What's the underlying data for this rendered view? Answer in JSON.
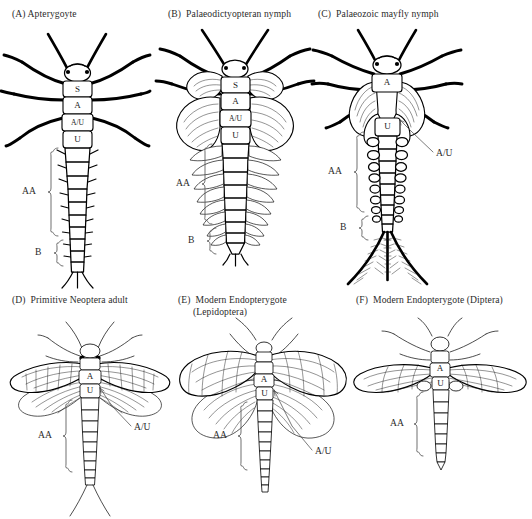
{
  "figure": {
    "background_color": "#ffffff",
    "ink_color": "#000000",
    "style": "black-and-white line drawing, scientific illustration"
  },
  "panels": [
    {
      "id": "A",
      "title": "(A) Apterygoyte",
      "segment_labels": [
        "S",
        "A",
        "A/U",
        "U"
      ],
      "brackets": [
        {
          "label": "AA"
        },
        {
          "label": "B"
        }
      ],
      "leader_labels": []
    },
    {
      "id": "B",
      "title": "(B)  Palaeodictyopteran nymph",
      "segment_labels": [
        "S",
        "A",
        "A/U",
        "U"
      ],
      "brackets": [
        {
          "label": "AA"
        },
        {
          "label": "B"
        }
      ],
      "leader_labels": []
    },
    {
      "id": "C",
      "title": "(C)  Palaeozoic mayfly nymph",
      "segment_labels": [
        "A",
        "U"
      ],
      "brackets": [
        {
          "label": "AA"
        },
        {
          "label": "B"
        }
      ],
      "leader_labels": [
        "A/U"
      ]
    },
    {
      "id": "D",
      "title": "(D)  Primitive Neoptera adult",
      "segment_labels": [
        "A",
        "U"
      ],
      "brackets": [
        {
          "label": "AA"
        }
      ],
      "leader_labels": [
        "A/U"
      ]
    },
    {
      "id": "E",
      "title": "(E)  Modern Endopterygote\n      (Lepidoptera)",
      "segment_labels": [
        "A",
        "U"
      ],
      "brackets": [
        {
          "label": "AA"
        }
      ],
      "leader_labels": [
        "A/U"
      ]
    },
    {
      "id": "F",
      "title": "(F)  Modern Endopterygote (Diptera)",
      "segment_labels": [
        "A",
        "U"
      ],
      "brackets": [
        {
          "label": "AA"
        }
      ],
      "leader_labels": []
    }
  ]
}
